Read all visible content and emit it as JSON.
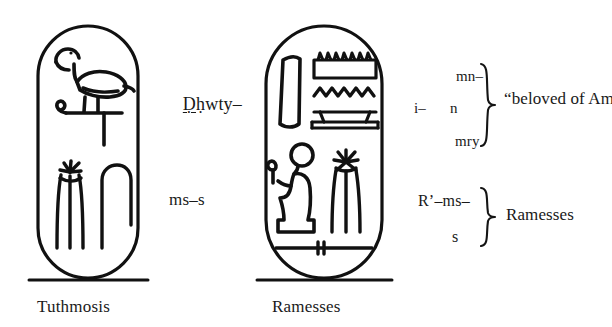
{
  "figure": {
    "background_color": "#ffffff",
    "ink_color": "#111111"
  },
  "cartouches": [
    {
      "id": "tuthmosis",
      "caption": "Tuthmosis",
      "glyphs": [
        {
          "name": "ibis-on-standard-glyph",
          "reads": "Dhwty",
          "meaning": "Thoth"
        },
        {
          "name": "three-fox-skins-glyph",
          "reads": "ms",
          "meaning": "born of"
        },
        {
          "name": "folded-cloth-glyph",
          "reads": "s"
        }
      ],
      "transliteration_lines": [
        {
          "id": "dhwty",
          "text": "Ḏḥwty–"
        },
        {
          "id": "ms-s",
          "text": "ms–s"
        }
      ]
    },
    {
      "id": "ramesses",
      "caption": "Ramesses",
      "glyphs": [
        {
          "name": "blade-feather-glyph",
          "reads": ""
        },
        {
          "name": "game-board-mn-glyph",
          "reads": "mn"
        },
        {
          "name": "water-ripple-n-glyph",
          "reads": "n"
        },
        {
          "name": "table-stand-glyph",
          "reads": ""
        },
        {
          "name": "seated-ra-figure-glyph",
          "reads": "R'",
          "meaning": "Ra"
        },
        {
          "name": "three-fox-skins-glyph",
          "reads": "ms",
          "meaning": "born of"
        },
        {
          "name": "door-bolt-s-glyph",
          "reads": "s"
        }
      ]
    }
  ],
  "annotations": {
    "amon_group": {
      "lines": [
        {
          "id": "mn",
          "text": "mn–"
        },
        {
          "id": "i",
          "text": "i–"
        },
        {
          "id": "n",
          "text": "n"
        },
        {
          "id": "mry",
          "text": "mry"
        }
      ],
      "brace": "right-curly-brace",
      "gloss": "“beloved of Amon”"
    },
    "ramesses_group": {
      "lines": [
        {
          "id": "ra-ms",
          "text": "R’–ms–"
        },
        {
          "id": "s",
          "text": "s"
        }
      ],
      "brace": "right-curly-brace",
      "gloss": "Ramesses"
    }
  },
  "captions": {
    "left": "Tuthmosis",
    "right": "Ramesses"
  }
}
